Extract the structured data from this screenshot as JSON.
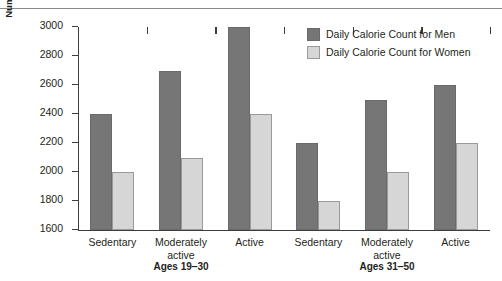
{
  "chart_data": {
    "type": "bar",
    "title": "",
    "xlabel": "",
    "ylabel": "Number of Calories per Day",
    "ylim": [
      1600,
      3000
    ],
    "ytick_step": 200,
    "yticks": [
      3000,
      2800,
      2600,
      2400,
      2200,
      2000,
      1800,
      1600
    ],
    "grid": false,
    "legend_position": "top-right",
    "categories": [
      "Sedentary",
      "Moderately\nactive",
      "Active",
      "Sedentary",
      "Moderately\nactive",
      "Active"
    ],
    "groups": [
      {
        "label": "Ages 19‒30",
        "categories": [
          "Sedentary",
          "Moderately\nactive",
          "Active"
        ]
      },
      {
        "label": "Ages 31‒50",
        "categories": [
          "Sedentary",
          "Moderately\nactive",
          "Active"
        ]
      }
    ],
    "series": [
      {
        "name": "Daily Calorie Count for Men",
        "color": "#767676",
        "values": [
          2400,
          2700,
          3000,
          2200,
          2500,
          2600
        ]
      },
      {
        "name": "Daily Calorie Count for Women",
        "color": "#d6d6d6",
        "values": [
          2000,
          2100,
          2400,
          1800,
          2000,
          2200
        ]
      }
    ]
  },
  "legend": {
    "items": [
      {
        "label": "Daily Calorie Count for Men",
        "swatch": "men"
      },
      {
        "label": "Daily Calorie Count for Women",
        "swatch": "women"
      }
    ]
  },
  "axis": {
    "y_title": "Number of Calories per Day"
  }
}
